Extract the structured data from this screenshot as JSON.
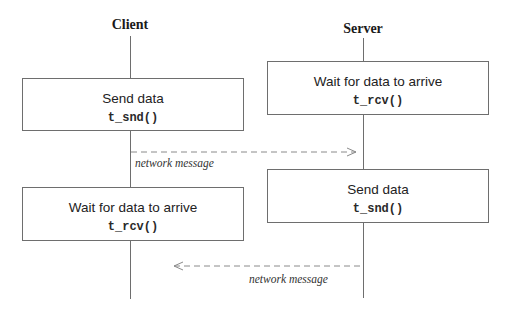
{
  "diagram": {
    "type": "sequence",
    "actors": [
      {
        "name": "Client"
      },
      {
        "name": "Server"
      }
    ],
    "client_steps": [
      {
        "description": "Send data",
        "call": "t_snd()"
      },
      {
        "description": "Wait for data to arrive",
        "call": "t_rcv()"
      }
    ],
    "server_steps": [
      {
        "description": "Wait for data to arrive",
        "call": "t_rcv()"
      },
      {
        "description": "Send data",
        "call": "t_snd()"
      }
    ],
    "messages": [
      {
        "from": "Client",
        "to": "Server",
        "label": "network message"
      },
      {
        "from": "Server",
        "to": "Client",
        "label": "network message"
      }
    ],
    "colors": {
      "line": "#6e6e6e",
      "dash": "#8a8a8a",
      "text": "#222222"
    }
  }
}
